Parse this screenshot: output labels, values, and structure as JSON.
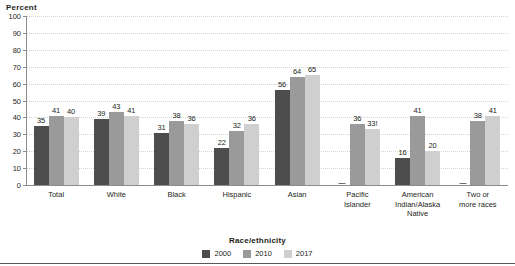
{
  "chart_data": {
    "type": "bar",
    "title": "",
    "xlabel": "Race/ethnicity",
    "ylabel": "Percent",
    "ylim": [
      0,
      100
    ],
    "ytick_step": 10,
    "yticks": [
      "100",
      "90",
      "80",
      "70",
      "60",
      "50",
      "40",
      "30",
      "20",
      "10",
      "0"
    ],
    "grid": true,
    "legend_position": "bottom-center",
    "categories": [
      "Total",
      "White",
      "Black",
      "Hispanic",
      "Asian",
      "Pacific Islander",
      "American Indian/Alaska Native",
      "Two or more races"
    ],
    "category_lines": [
      [
        "Total"
      ],
      [
        "White"
      ],
      [
        "Black"
      ],
      [
        "Hispanic"
      ],
      [
        "Asian"
      ],
      [
        "Pacific",
        "Islander"
      ],
      [
        "American",
        "Indian/Alaska",
        "Native"
      ],
      [
        "Two or",
        "more races"
      ]
    ],
    "series": [
      {
        "name": "2000",
        "color": "#4d4d4d",
        "values": [
          35,
          39,
          31,
          22,
          56,
          null,
          16,
          null
        ],
        "labels": [
          "35",
          "39",
          "31",
          "22",
          "56",
          "—",
          "16",
          "—"
        ]
      },
      {
        "name": "2010",
        "color": "#9a9a9a",
        "values": [
          41,
          43,
          38,
          32,
          64,
          36,
          41,
          38
        ],
        "labels": [
          "41",
          "43",
          "38",
          "32",
          "64",
          "36",
          "41",
          "38"
        ]
      },
      {
        "name": "2017",
        "color": "#cfcfcf",
        "values": [
          40,
          41,
          36,
          36,
          65,
          33,
          20,
          41
        ],
        "labels": [
          "40",
          "41",
          "36",
          "36",
          "65",
          "33!",
          "20",
          "41"
        ]
      }
    ]
  },
  "legend": {
    "items": [
      {
        "label": "2000"
      },
      {
        "label": "2010"
      },
      {
        "label": "2017"
      }
    ]
  }
}
